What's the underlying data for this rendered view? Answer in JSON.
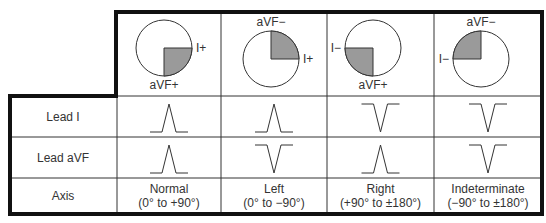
{
  "columns": [
    {
      "key": "normal",
      "name": "Normal",
      "range": "(0° to +90°)",
      "lead_i": "up",
      "lead_avf": "up",
      "wheel": {
        "quadrant": "bottom-right",
        "top_label": "",
        "bottom_label": "aVF+",
        "side_label": "I+",
        "side": "right"
      }
    },
    {
      "key": "left",
      "name": "Left",
      "range": "(0° to −90°)",
      "lead_i": "up",
      "lead_avf": "down",
      "wheel": {
        "quadrant": "top-right",
        "top_label": "aVF−",
        "bottom_label": "",
        "side_label": "I+",
        "side": "right"
      }
    },
    {
      "key": "right",
      "name": "Right",
      "range": "(+90° to ±180°)",
      "lead_i": "down",
      "lead_avf": "up",
      "wheel": {
        "quadrant": "bottom-left",
        "top_label": "",
        "bottom_label": "aVF+",
        "side_label": "I−",
        "side": "left"
      }
    },
    {
      "key": "indeterminate",
      "name": "Indeterminate",
      "range": "(−90° to ±180°)",
      "lead_i": "down",
      "lead_avf": "down",
      "wheel": {
        "quadrant": "top-left",
        "top_label": "aVF−",
        "bottom_label": "",
        "side_label": "I−",
        "side": "left"
      }
    }
  ],
  "rows": {
    "lead_i": "Lead I",
    "lead_avf": "Lead aVF",
    "axis": "Axis"
  },
  "colors": {
    "border": "#111111",
    "grid": "#333333",
    "shade": "#9a9a9a"
  }
}
